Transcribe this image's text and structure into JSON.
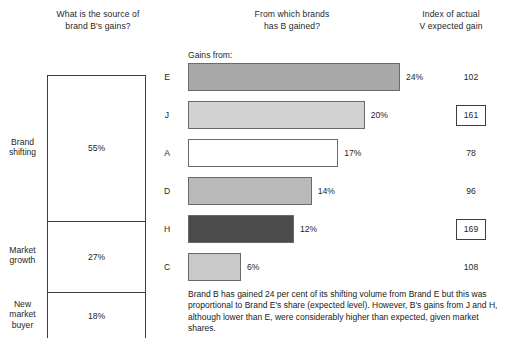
{
  "headings": {
    "left": "What is the source of\nbrand B's gains?",
    "middle": "From which brands\nhas B gained?",
    "right": "Index of actual\nV expected gain"
  },
  "gains_from_label": "Gains from:",
  "caption": "Brand B has gained 24 per cent of its shifting volume from Brand E but this was proportional to Brand E's share (expected level). However, B's gains from J and H, although lower than E, were considerably higher than expected, given market shares.",
  "chart_data": [
    {
      "type": "bar",
      "title": "What is the source of brand B's gains?",
      "orientation": "stacked-vertical",
      "categories": [
        "Brand shifting",
        "Market growth",
        "New market buyer"
      ],
      "values": [
        55,
        27,
        18
      ],
      "value_labels": [
        "55%",
        "27%",
        "18%"
      ],
      "unit": "%",
      "ylim": [
        0,
        100
      ],
      "grid": false,
      "legend": "none"
    },
    {
      "type": "bar",
      "title": "From which brands has B gained?",
      "orientation": "horizontal",
      "xlabel": "",
      "ylabel": "Gains from:",
      "categories": [
        "E",
        "J",
        "A",
        "D",
        "H",
        "C"
      ],
      "values": [
        24,
        20,
        17,
        14,
        12,
        6
      ],
      "value_labels": [
        "24%",
        "20%",
        "17%",
        "14%",
        "12%",
        "6%"
      ],
      "bar_colors": [
        "#a9a9a9",
        "#d2d2d2",
        "#ffffff",
        "#b9b9b9",
        "#4b4b4b",
        "#c9c9c9"
      ],
      "unit": "%",
      "xlim": [
        0,
        24
      ],
      "grid": false,
      "legend": "none"
    },
    {
      "type": "table",
      "title": "Index of actual V expected gain",
      "categories": [
        "E",
        "J",
        "A",
        "D",
        "H",
        "C"
      ],
      "values": [
        102,
        161,
        78,
        96,
        169,
        108
      ],
      "highlighted": [
        false,
        true,
        false,
        false,
        true,
        false
      ]
    }
  ],
  "left_panel": {
    "segments": [
      {
        "label": "Brand\nshifting",
        "value_label": "55%"
      },
      {
        "label": "Market\ngrowth",
        "value_label": "27%"
      },
      {
        "label": "New\nmarket\nbuyer",
        "value_label": "18%"
      }
    ]
  },
  "bars": [
    {
      "letter": "E",
      "value_label": "24%",
      "index_label": "102",
      "boxed": false
    },
    {
      "letter": "J",
      "value_label": "20%",
      "index_label": "161",
      "boxed": true
    },
    {
      "letter": "A",
      "value_label": "17%",
      "index_label": "78",
      "boxed": false
    },
    {
      "letter": "D",
      "value_label": "14%",
      "index_label": "96",
      "boxed": false
    },
    {
      "letter": "H",
      "value_label": "12%",
      "index_label": "169",
      "boxed": true
    },
    {
      "letter": "C",
      "value_label": "6%",
      "index_label": "108",
      "boxed": false
    }
  ]
}
